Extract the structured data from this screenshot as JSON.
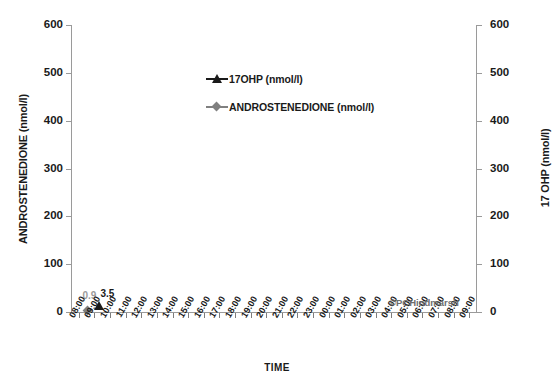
{
  "chart_data": {
    "type": "scatter",
    "title": "",
    "xlabel": "TIME",
    "ylabel_left": "ANDROSTENEDIONE (nmol/l)",
    "ylabel_right": "17 OHP (nmol/l)",
    "ylim": [
      0,
      600
    ],
    "ytick_labels": [
      "0",
      "100",
      "200",
      "300",
      "400",
      "500",
      "600"
    ],
    "ytick_values": [
      0,
      100,
      200,
      300,
      400,
      500,
      600
    ],
    "grid": false,
    "legend_position": "upper-center",
    "categories": [
      "08:00",
      "09:00",
      "10:00",
      "11:00",
      "12:00",
      "13:00",
      "14:00",
      "15:00",
      "16:00",
      "17:00",
      "18:00",
      "19:00",
      "20:00",
      "21:00",
      "22:00",
      "23:00",
      "00:00",
      "01:00",
      "02:00",
      "03:00",
      "04:00",
      "05:00",
      "06:00",
      "07:00",
      "08:00",
      "09:00"
    ],
    "series": [
      {
        "name": "17OHP (nmol/l)",
        "legend_label": "17OHP (nmol/l)",
        "marker": "triangle",
        "color": "#1a1a1a",
        "axis": "right",
        "points": [
          {
            "x": "09:00",
            "y": 3.5,
            "label": "3.5"
          }
        ]
      },
      {
        "name": "ANDROSTENEDIONE (nmol/l)",
        "legend_label": "ANDROSTENEDIONE (nmol/l)",
        "marker": "diamond",
        "color": "#808080",
        "axis": "left",
        "points": [
          {
            "x": "09:00",
            "y": 0.9,
            "label": "0.9"
          }
        ]
      }
    ],
    "annotations": [
      {
        "text": "©PCHindmarsh",
        "color": "#6e6e6e"
      }
    ]
  },
  "watermark": "©PCHindmarsh"
}
